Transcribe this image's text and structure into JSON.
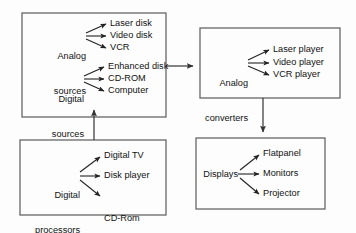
{
  "diagram": {
    "type": "block-flow",
    "colors": {
      "background": "#fdfdfd",
      "box_border": "#5a5a5a",
      "arrow": "#333333",
      "text": "#111111"
    },
    "blocks": [
      {
        "id": "analog-sources-block",
        "groups": [
          {
            "source": "Analog\nsources",
            "source_line1": "Analog",
            "source_line2": "sources",
            "outputs": [
              "Laser disk",
              "Video disk",
              "VCR"
            ]
          },
          {
            "source": "Digital\nsources",
            "source_line1": "Digital",
            "source_line2": "sources",
            "outputs": [
              "Enhanced disk",
              "CD-ROM",
              "Computer"
            ]
          }
        ]
      },
      {
        "id": "analog-converters-block",
        "groups": [
          {
            "source": "Analog\nconverters",
            "source_line1": "Analog",
            "source_line2": "converters",
            "outputs": [
              "Laser player",
              "Video player",
              "VCR player"
            ]
          }
        ]
      },
      {
        "id": "digital-processors-block",
        "groups": [
          {
            "source": "Digital\nprocessors",
            "source_line1": "Digital",
            "source_line2": "processors",
            "outputs": [
              "Digital TV",
              "Disk player",
              "CD-Rom\ndrive"
            ]
          }
        ]
      },
      {
        "id": "displays-block",
        "groups": [
          {
            "source": "Displays",
            "source_line1": "Displays",
            "source_line2": "",
            "outputs": [
              "Flatpanel",
              "Monitors",
              "Projector"
            ]
          }
        ]
      }
    ],
    "connectors": [
      {
        "name": "sources-to-converters",
        "direction": "right"
      },
      {
        "name": "processors-to-sources",
        "direction": "up"
      },
      {
        "name": "converters-to-displays",
        "direction": "down"
      }
    ],
    "labels": {
      "analog_sources_l1": "Analog",
      "analog_sources_l2": "sources",
      "laser_disk": "Laser disk",
      "video_disk": "Video disk",
      "vcr": "VCR",
      "digital_sources_l1": "Digital",
      "digital_sources_l2": "sources",
      "enhanced_disk": "Enhanced disk",
      "cd_rom": "CD-ROM",
      "computer": "Computer",
      "analog_converters_l1": "Analog",
      "analog_converters_l2": "converters",
      "laser_player": "Laser player",
      "video_player": "Video player",
      "vcr_player": "VCR player",
      "digital_processors_l1": "Digital",
      "digital_processors_l2": "processors",
      "digital_tv": "Digital TV",
      "disk_player": "Disk player",
      "cd_rom_drive_l1": "CD-Rom",
      "cd_rom_drive_l2": "drive",
      "displays": "Displays",
      "flatpanel": "Flatpanel",
      "monitors": "Monitors",
      "projector": "Projector"
    }
  }
}
